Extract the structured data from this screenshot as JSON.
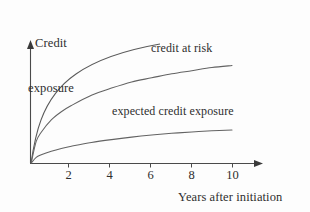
{
  "figure": {
    "background_color": "#fdfdfd",
    "ink_color": "#4a4a4a",
    "text_color": "#2e2e2e"
  },
  "axes": {
    "y_title_line1": "Credit",
    "y_title_line2": "exposure",
    "x_title": "Years after initiation"
  },
  "annotations": {
    "upper_curve_label": "credit at risk",
    "lower_curve_label": "expected credit exposure"
  },
  "ticks": {
    "x": [
      "2",
      "4",
      "6",
      "8",
      "10"
    ]
  },
  "chart_data": {
    "type": "line",
    "title": "",
    "subtitle": "",
    "xlabel": "Years after initiation",
    "ylabel": "Credit exposure",
    "xlim": [
      0,
      11
    ],
    "ylim": [
      0,
      1.15
    ],
    "grid": false,
    "legend": "inline-annotations",
    "x_tick_labels": [
      "2",
      "4",
      "6",
      "8",
      "10"
    ],
    "x_tick_values": [
      2,
      4,
      6,
      8,
      10
    ],
    "y_tick_labels": [],
    "x": [
      0,
      0.25,
      0.5,
      1,
      1.5,
      2,
      3,
      4,
      5,
      6,
      7,
      8,
      9,
      10
    ],
    "series": [
      {
        "name": "credit at risk",
        "label_position": {
          "x": 6.2,
          "y": 1.02
        },
        "values": [
          0.0,
          0.21,
          0.3,
          0.42,
          0.5,
          0.56,
          0.66,
          0.73,
          0.79,
          0.83,
          0.87,
          0.9,
          0.93,
          0.95
        ],
        "shape": "concave-increasing (square-root-like)"
      },
      {
        "name": "expected credit exposure",
        "label_position": {
          "x": 4.2,
          "y": 0.52
        },
        "values": [
          0.0,
          0.055,
          0.08,
          0.115,
          0.142,
          0.163,
          0.2,
          0.228,
          0.252,
          0.272,
          0.289,
          0.303,
          0.314,
          0.322
        ],
        "shape": "concave-increasing (square-root-like, lower amplitude)"
      }
    ]
  }
}
